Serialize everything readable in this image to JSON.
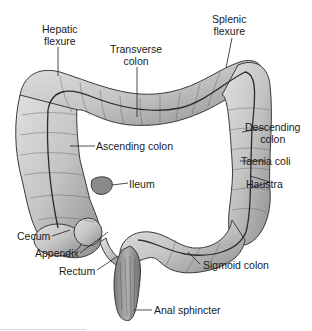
{
  "diagram": {
    "type": "anatomical-illustration",
    "colors": {
      "background": "#ffffff",
      "organ_fill": "#c9c9c9",
      "organ_shade": "#9a9a9a",
      "outline": "#3a3a3a",
      "leader_line": "#222222",
      "text": "#1a1a1a"
    },
    "labels": {
      "hepatic_flexure": [
        "Hepatic",
        "flexure"
      ],
      "transverse_colon": [
        "Transverse",
        "colon"
      ],
      "splenic_flexure": [
        "Splenic",
        "flexure"
      ],
      "descending_colon": [
        "Descending",
        "colon"
      ],
      "taenia_coli": "Taenia coli",
      "haustra": "Haustra",
      "ascending_colon": "Ascending colon",
      "ileum": "Ileum",
      "cecum": "Cecum",
      "appendix": "Appendix",
      "rectum": "Rectum",
      "sigmoid_colon": "Sigmoid colon",
      "anal_sphincter": "Anal sphincter"
    }
  }
}
